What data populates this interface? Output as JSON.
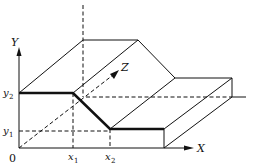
{
  "diagram": {
    "type": "3d-step-surface",
    "axes": {
      "x_label": "X",
      "y_label": "Y",
      "z_label": "Z",
      "origin_label": "0"
    },
    "ticks": {
      "x1": {
        "base": "x",
        "sub": "1"
      },
      "x2": {
        "base": "x",
        "sub": "2"
      },
      "y1": {
        "base": "y",
        "sub": "1"
      },
      "y2": {
        "base": "y",
        "sub": "2"
      }
    },
    "profile": {
      "description": "Thick profile: constant y2 from 0 to x1, linear descent from (x1,y2) to (x2,y1), constant y1 beyond x2",
      "points": [
        [
          "0",
          "y2"
        ],
        [
          "x1",
          "y2"
        ],
        [
          "x2",
          "y1"
        ],
        [
          "end",
          "y1"
        ]
      ]
    },
    "colors": {
      "line": "#111111",
      "background": "#ffffff"
    }
  }
}
